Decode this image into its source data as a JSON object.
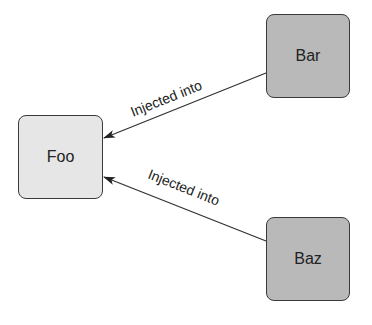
{
  "diagram": {
    "nodes": [
      {
        "id": "foo",
        "label": "Foo",
        "fill": "#e6e6e6"
      },
      {
        "id": "bar",
        "label": "Bar",
        "fill": "#b9b9b9"
      },
      {
        "id": "baz",
        "label": "Baz",
        "fill": "#b9b9b9"
      }
    ],
    "edges": [
      {
        "from": "bar",
        "to": "foo",
        "label": "Injected into"
      },
      {
        "from": "baz",
        "to": "foo",
        "label": "Injected into"
      }
    ]
  }
}
